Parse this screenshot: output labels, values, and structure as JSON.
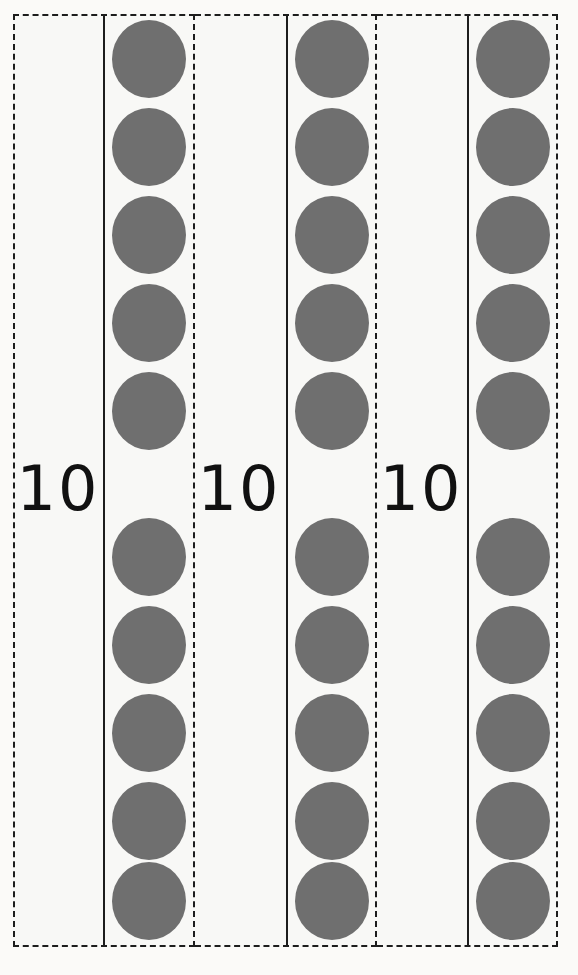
{
  "worksheet": {
    "title": "Base-ten dot groups",
    "description": "Three dashed groups, each labelled 10 and each holding a column of ten grey dots",
    "canvas": {
      "width": 578,
      "height": 975
    },
    "colors": {
      "background": "#fbfaf8",
      "card_background": "#f8f8f6",
      "dot": "#6f6f6f",
      "line": "#1d1d1d",
      "label_text": "#111111"
    },
    "geometry": {
      "box_top": 14,
      "box_bottom": 947,
      "dot_width": 74,
      "dot_height": 78,
      "dot_pitch": 88,
      "dot_rows_top": [
        20,
        108,
        196,
        284,
        372
      ],
      "dot_rows_bottom": [
        518,
        606,
        694,
        782,
        862
      ]
    },
    "groups": [
      {
        "id": "group-1",
        "label": "10",
        "dot_count": 10,
        "box_left": 13,
        "box_width": 182,
        "label_left": 13,
        "divider_x": 103,
        "column_left": 103,
        "continues_left": false
      },
      {
        "id": "group-2",
        "label": "10",
        "dot_count": 10,
        "box_left": 195,
        "box_width": 182,
        "label_left": 194,
        "divider_x": 286,
        "column_left": 286,
        "continues_left": true
      },
      {
        "id": "group-3",
        "label": "10",
        "dot_count": 10,
        "box_left": 377,
        "box_width": 181,
        "label_left": 376,
        "divider_x": 467,
        "column_left": 467,
        "continues_left": true
      }
    ]
  },
  "chart_data": {
    "type": "bar",
    "categories": [
      "10",
      "10",
      "10"
    ],
    "values": [
      10,
      10,
      10
    ],
    "xlabel": "",
    "ylabel": "Dots per group",
    "ylim": [
      0,
      10
    ],
    "total": 30
  }
}
